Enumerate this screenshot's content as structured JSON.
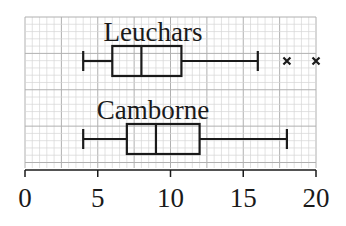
{
  "chart_data": {
    "type": "boxplot",
    "title": "",
    "xlabel": "",
    "ylabel": "",
    "xlim": [
      0,
      20
    ],
    "x_ticks": [
      0,
      5,
      10,
      15,
      20
    ],
    "x_tick_labels": [
      "0",
      "5",
      "10",
      "15",
      "20"
    ],
    "grid": true,
    "series": [
      {
        "name": "Leuchars",
        "min": 4,
        "q1": 6,
        "median": 8,
        "q3": 10.75,
        "max": 16,
        "outliers": [
          18,
          20
        ]
      },
      {
        "name": "Camborne",
        "min": 4,
        "q1": 7,
        "median": 9,
        "q3": 12,
        "max": 18,
        "outliers": []
      }
    ]
  },
  "colors": {
    "grid_minor": "#d6d6d6",
    "grid_major": "#b0b0b0",
    "ink": "#1a1a1a"
  }
}
